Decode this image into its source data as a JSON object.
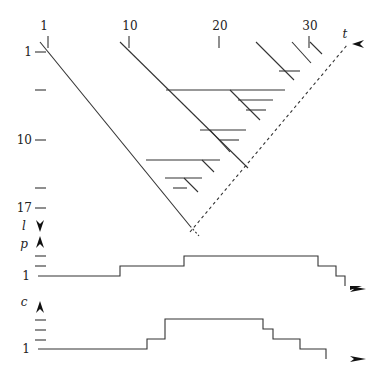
{
  "diagram": {
    "top_axis": {
      "label": "t",
      "ticks": [
        {
          "label": "1",
          "x": 44
        },
        {
          "label": "10",
          "x": 130
        },
        {
          "label": "20",
          "x": 220
        },
        {
          "label": "30",
          "x": 310
        }
      ]
    },
    "left_axis": {
      "ticks": [
        {
          "label": "1",
          "y": 52
        },
        {
          "label": "",
          "y": 90
        },
        {
          "label": "10",
          "y": 140
        },
        {
          "label": "",
          "y": 188
        },
        {
          "label": "17",
          "y": 208
        }
      ],
      "arrow_label": "l"
    },
    "p_chart": {
      "label": "p",
      "baseline_label": "1",
      "steps": "1 → 2 → 3 (plateau) → 2 → 1"
    },
    "c_chart": {
      "label": "c",
      "baseline_label": "1",
      "steps": "1 → 2 → 4 (plateau) → 3 → 2 → 1"
    }
  }
}
